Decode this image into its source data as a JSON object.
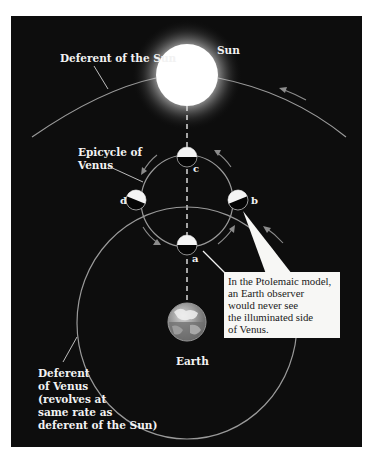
{
  "figure": {
    "background_color": "#0d0d0d",
    "panel": {
      "x": 11,
      "y": 16,
      "width": 351,
      "height": 431
    }
  },
  "labels": {
    "sun": "Sun",
    "deferent_sun": "Deferent of the Sun",
    "epicycle_line1": "Epicycle of",
    "epicycle_line2": "Venus",
    "earth": "Earth",
    "deferent_venus_lines": [
      "Deferent",
      "of Venus",
      "(revolves at",
      "same rate as",
      "deferent of the Sun)"
    ],
    "position_a": "a",
    "position_b": "b",
    "position_c": "c",
    "position_d": "d"
  },
  "callout": {
    "lines": [
      "In the Ptolemaic model,",
      "an Earth observer",
      "would never see",
      "the illuminated side",
      "of Venus."
    ]
  },
  "bodies": {
    "sun": {
      "cx": 187,
      "cy": 75,
      "r": 31,
      "color": "#ffffff"
    },
    "earth": {
      "cx": 187,
      "cy": 322,
      "r": 19
    },
    "venus_radius": 10,
    "venus_positions": [
      {
        "id": "a",
        "cx": 187,
        "cy": 245
      },
      {
        "id": "b",
        "cx": 238,
        "cy": 200
      },
      {
        "id": "c",
        "cx": 187,
        "cy": 157
      },
      {
        "id": "d",
        "cx": 136,
        "cy": 200
      }
    ]
  },
  "orbits": {
    "deferent_sun": {
      "cx": 187,
      "cy": 330,
      "r": 255
    },
    "epicycle_venus": {
      "cx": 187,
      "cy": 201,
      "r": 46
    },
    "deferent_venus": {
      "cx": 187,
      "cy": 323,
      "rx": 110,
      "ry": 116
    }
  }
}
